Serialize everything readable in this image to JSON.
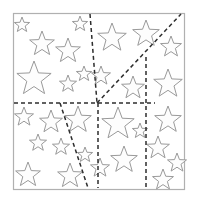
{
  "page": {
    "width": 197,
    "height": 203,
    "background_color": "#ffffff"
  },
  "frame": {
    "name": "outer-border",
    "x": 13,
    "y": 13,
    "width": 171,
    "height": 176,
    "stroke_color": "#b0b0b0",
    "fill_color": "#ffffff"
  },
  "style": {
    "star_stroke_color": "#9a9a9a",
    "star_fill_color": "#fdfdfd",
    "cut_line_color": "#2e2e2e",
    "cut_line_dash": "4 3"
  },
  "cut_lines": [
    {
      "id": "vertical-upper-divider",
      "x1": 90,
      "y1": 14,
      "x2": 97,
      "y2": 103
    },
    {
      "id": "horizontal-middle-divider",
      "x1": 14,
      "y1": 103,
      "x2": 155,
      "y2": 103
    },
    {
      "id": "diagonal-upper-right",
      "x1": 97,
      "y1": 103,
      "x2": 181,
      "y2": 14
    },
    {
      "id": "vertical-right-divider",
      "x1": 146,
      "y1": 57,
      "x2": 146,
      "y2": 188
    },
    {
      "id": "slanted-lower-left",
      "x1": 60,
      "y1": 103,
      "x2": 88,
      "y2": 188
    },
    {
      "id": "vertical-lower-middle",
      "x1": 98,
      "y1": 103,
      "x2": 98,
      "y2": 188
    }
  ],
  "stars": [
    {
      "id": "star-01",
      "cx": 22,
      "cy": 25,
      "r": 8,
      "rot": 0
    },
    {
      "id": "star-02",
      "cx": 80,
      "cy": 24,
      "r": 8,
      "rot": 0
    },
    {
      "id": "star-03",
      "cx": 42,
      "cy": 44,
      "r": 13,
      "rot": 0
    },
    {
      "id": "star-04",
      "cx": 68,
      "cy": 51,
      "r": 13,
      "rot": 0
    },
    {
      "id": "star-05",
      "cx": 34,
      "cy": 79,
      "r": 18,
      "rot": 0
    },
    {
      "id": "star-06",
      "cx": 68,
      "cy": 84,
      "r": 9,
      "rot": 0
    },
    {
      "id": "star-07",
      "cx": 84,
      "cy": 74,
      "r": 8,
      "rot": 0
    },
    {
      "id": "star-08",
      "cx": 112,
      "cy": 38,
      "r": 15,
      "rot": 0
    },
    {
      "id": "star-09",
      "cx": 146,
      "cy": 34,
      "r": 14,
      "rot": 0
    },
    {
      "id": "star-10",
      "cx": 171,
      "cy": 47,
      "r": 11,
      "rot": 0
    },
    {
      "id": "star-11",
      "cx": 101,
      "cy": 76,
      "r": 10,
      "rot": 0
    },
    {
      "id": "star-12",
      "cx": 133,
      "cy": 88,
      "r": 12,
      "rot": 0
    },
    {
      "id": "star-13",
      "cx": 168,
      "cy": 84,
      "r": 15,
      "rot": 0
    },
    {
      "id": "star-14",
      "cx": 24,
      "cy": 117,
      "r": 10,
      "rot": 0
    },
    {
      "id": "star-15",
      "cx": 51,
      "cy": 122,
      "r": 12,
      "rot": 0
    },
    {
      "id": "star-16",
      "cx": 78,
      "cy": 120,
      "r": 14,
      "rot": 0
    },
    {
      "id": "star-17",
      "cx": 38,
      "cy": 143,
      "r": 9,
      "rot": 0
    },
    {
      "id": "star-18",
      "cx": 61,
      "cy": 147,
      "r": 9,
      "rot": 0
    },
    {
      "id": "star-19",
      "cx": 85,
      "cy": 155,
      "r": 8,
      "rot": 0
    },
    {
      "id": "star-20",
      "cx": 28,
      "cy": 175,
      "r": 13,
      "rot": 0
    },
    {
      "id": "star-21",
      "cx": 70,
      "cy": 176,
      "r": 13,
      "rot": 0
    },
    {
      "id": "star-22",
      "cx": 118,
      "cy": 124,
      "r": 17,
      "rot": 0
    },
    {
      "id": "star-23",
      "cx": 140,
      "cy": 131,
      "r": 8,
      "rot": 0
    },
    {
      "id": "star-24",
      "cx": 124,
      "cy": 160,
      "r": 14,
      "rot": 0
    },
    {
      "id": "star-25",
      "cx": 100,
      "cy": 168,
      "r": 10,
      "rot": 0
    },
    {
      "id": "star-26",
      "cx": 168,
      "cy": 120,
      "r": 14,
      "rot": 0
    },
    {
      "id": "star-27",
      "cx": 158,
      "cy": 148,
      "r": 12,
      "rot": 0
    },
    {
      "id": "star-28",
      "cx": 177,
      "cy": 163,
      "r": 10,
      "rot": 0
    },
    {
      "id": "star-29",
      "cx": 163,
      "cy": 180,
      "r": 11,
      "rot": 0
    }
  ]
}
